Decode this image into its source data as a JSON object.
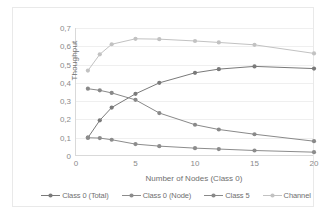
{
  "chart_data": {
    "type": "line",
    "title": "",
    "xlabel": "Number of  Nodes (Class 0)",
    "ylabel": "Thoughput",
    "x": [
      1,
      2,
      3,
      5,
      7,
      10,
      12,
      15,
      20
    ],
    "xlim": [
      0,
      20
    ],
    "ylim": [
      0,
      0.7
    ],
    "xticks": [
      "0",
      "5",
      "10",
      "15",
      "20"
    ],
    "xtick_values": [
      0,
      5,
      10,
      15,
      20
    ],
    "yticks": [
      "0",
      "0,1",
      "0,2",
      "0,3",
      "0,4",
      "0,5",
      "0,6",
      "0,7"
    ],
    "ytick_values": [
      0,
      0.1,
      0.2,
      0.3,
      0.4,
      0.5,
      0.6,
      0.7
    ],
    "grid": "horizontal",
    "legend_position": "bottom",
    "decimal_separator": ",",
    "series": [
      {
        "name": "Class 0 (Total)",
        "color": "#7a7a7a",
        "marker": "circle",
        "values": [
          0.1,
          0.195,
          0.265,
          0.34,
          0.4,
          0.455,
          0.475,
          0.49,
          0.478
        ]
      },
      {
        "name": "Class 0 (Node)",
        "color": "#8c8c8c",
        "marker": "circle",
        "values": [
          0.1,
          0.098,
          0.089,
          0.065,
          0.054,
          0.043,
          0.038,
          0.03,
          0.021
        ]
      },
      {
        "name": "Class 5",
        "color": "#898989",
        "marker": "circle",
        "values": [
          0.368,
          0.359,
          0.345,
          0.307,
          0.235,
          0.171,
          0.145,
          0.119,
          0.081
        ]
      },
      {
        "name": "Channel",
        "color": "#c2c2c2",
        "marker": "circle",
        "values": [
          0.467,
          0.556,
          0.611,
          0.641,
          0.639,
          0.629,
          0.621,
          0.608,
          0.561
        ]
      }
    ]
  },
  "axes": {
    "y_title": "Thoughput",
    "x_title": "Number of  Nodes (Class 0)"
  },
  "legend": {
    "items": [
      {
        "label": "Class 0 (Total)"
      },
      {
        "label": "Class 0 (Node)"
      },
      {
        "label": "Class 5"
      },
      {
        "label": "Channel"
      }
    ]
  },
  "colors": {
    "grid": "#efefef",
    "axis": "#d9d9d9",
    "frame": "#e9e9e9",
    "tick_text": "#8a8a8a",
    "title_text": "#6f6f6f",
    "background": "#ffffff"
  }
}
